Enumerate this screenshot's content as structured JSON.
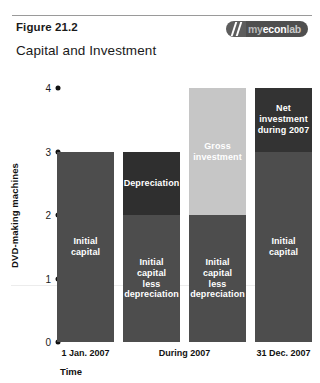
{
  "header": {
    "figure_label": "Figure 21.2",
    "figure_title": "Capital and Investment",
    "logo": {
      "name": "myeconlab-logo",
      "part_my": "my",
      "part_econ": "econ",
      "part_lab": "lab"
    }
  },
  "chart_data": {
    "type": "bar",
    "stacked": true,
    "title": "Capital and Investment",
    "xlabel": "Time",
    "ylabel": "DVD-making machines",
    "ylim": [
      0,
      4
    ],
    "yticks": [
      "0",
      "1",
      "2",
      "3",
      "4"
    ],
    "grid": true,
    "gridlines_at": [
      1
    ],
    "legend": "none",
    "categories": [
      "1 Jan. 2007",
      "During 2007",
      "31 Dec. 2007"
    ],
    "colors": {
      "capital": "#4d4d4d",
      "depreciation": "#2f2f2f",
      "gross_investment": "#c6c6c6",
      "net_investment": "#333333",
      "axis_text": "#111111",
      "gridline": "#ececec",
      "background": "#ffffff"
    },
    "bars": [
      {
        "category": "1 Jan. 2007",
        "total": 3,
        "segments": [
          {
            "label": "Initial\ncapital",
            "from": 0,
            "to": 3,
            "value": 3,
            "color_key": "capital"
          }
        ]
      },
      {
        "category": "During 2007",
        "total": 3,
        "segments": [
          {
            "label": "Depreciation",
            "from": 2,
            "to": 3,
            "value": 1,
            "color_key": "depreciation"
          },
          {
            "label": "Initial\ncapital\nless\ndepreciation",
            "from": 0,
            "to": 2,
            "value": 2,
            "color_key": "capital"
          }
        ]
      },
      {
        "category": "During 2007",
        "total": 4,
        "segments": [
          {
            "label": "Gross\ninvestment",
            "from": 2,
            "to": 4,
            "value": 2,
            "color_key": "gross_investment"
          },
          {
            "label": "Initial\ncapital\nless\ndepreciation",
            "from": 0,
            "to": 2,
            "value": 2,
            "color_key": "capital"
          }
        ]
      },
      {
        "category": "31 Dec. 2007",
        "total": 4,
        "segments": [
          {
            "label": "Net\ninvestment\nduring 2007",
            "from": 3,
            "to": 4,
            "value": 1,
            "color_key": "net_investment"
          },
          {
            "label": "Initial\ncapital",
            "from": 0,
            "to": 3,
            "value": 3,
            "color_key": "capital"
          }
        ]
      }
    ],
    "xtick_positions": [
      {
        "label": "1 Jan. 2007",
        "bar_index": 0
      },
      {
        "label": "During 2007",
        "bar_index": 1.5
      },
      {
        "label": "31 Dec. 2007",
        "bar_index": 3
      }
    ]
  }
}
